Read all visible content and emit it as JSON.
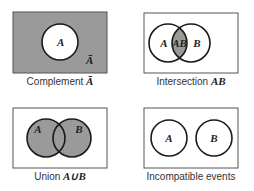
{
  "colors": {
    "shade": "#9a9a9a",
    "stroke": "#1a1a1a",
    "box_stroke": "#555555",
    "background": "#ffffff"
  },
  "panels": [
    {
      "id": "complement",
      "caption_text": "Complement ",
      "caption_math": "Ā",
      "circle_label_a": "A",
      "outside_label": "Ā"
    },
    {
      "id": "intersection",
      "caption_text": "Intersection ",
      "caption_math": "AB",
      "circle_label_a": "A",
      "overlap_label": "AB",
      "circle_label_b": "B"
    },
    {
      "id": "union",
      "caption_text": "Union ",
      "caption_math": "A∪B",
      "circle_label_a": "A",
      "circle_label_b": "B"
    },
    {
      "id": "incompatible",
      "caption_text": "Incompatible events",
      "circle_label_a": "A",
      "circle_label_b": "B"
    }
  ]
}
